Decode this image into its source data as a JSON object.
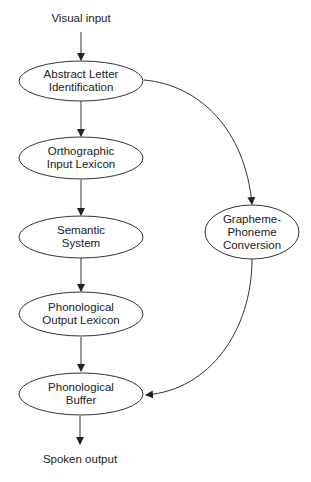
{
  "diagram": {
    "type": "flow",
    "input_label": "Visual input",
    "output_label": "Spoken output",
    "nodes": [
      {
        "id": "ali",
        "lines": [
          "Abstract Letter",
          "Identification"
        ]
      },
      {
        "id": "oil",
        "lines": [
          "Orthographic",
          "Input Lexicon"
        ]
      },
      {
        "id": "sem",
        "lines": [
          "Semantic",
          "System"
        ]
      },
      {
        "id": "pol",
        "lines": [
          "Phonological",
          "Output Lexicon"
        ]
      },
      {
        "id": "pb",
        "lines": [
          "Phonological",
          "Buffer"
        ]
      },
      {
        "id": "gpc",
        "lines": [
          "Grapheme-",
          "Phoneme",
          "Conversion"
        ]
      }
    ],
    "edges": [
      {
        "from": "Visual input",
        "to": "ali"
      },
      {
        "from": "ali",
        "to": "oil"
      },
      {
        "from": "oil",
        "to": "sem"
      },
      {
        "from": "sem",
        "to": "pol"
      },
      {
        "from": "pol",
        "to": "pb"
      },
      {
        "from": "pb",
        "to": "Spoken output"
      },
      {
        "from": "ali",
        "to": "gpc"
      },
      {
        "from": "gpc",
        "to": "pb"
      }
    ],
    "colors": {
      "stroke": "#333333",
      "text": "#222222",
      "background": "#ffffff"
    }
  }
}
